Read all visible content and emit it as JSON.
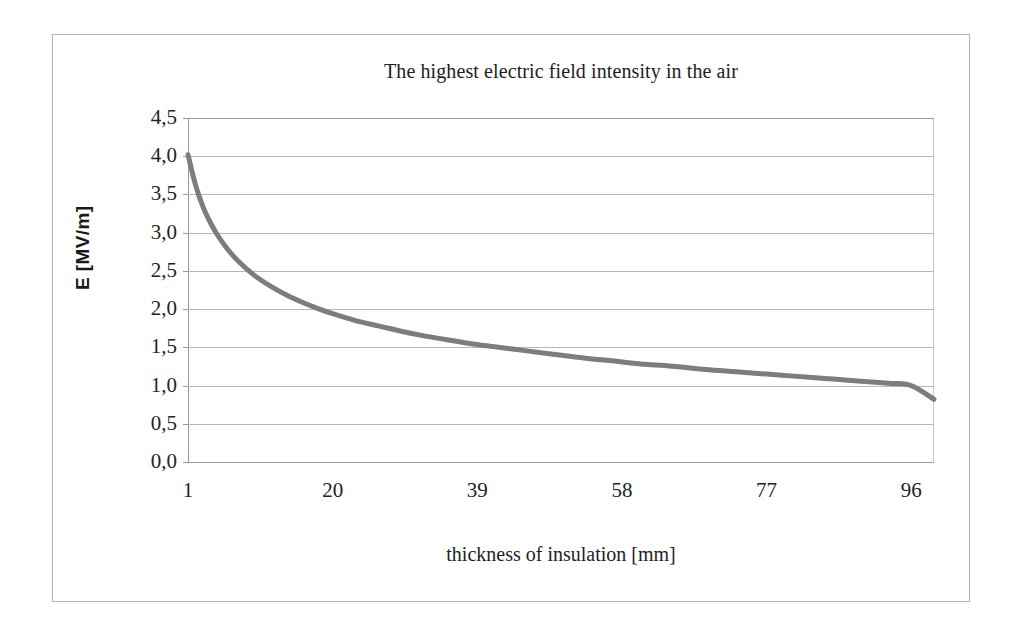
{
  "figure": {
    "frame_border_color": "#b4b4b4",
    "background_color": "#ffffff"
  },
  "chart_data": {
    "type": "line",
    "title": "The highest electric field intensity in the air",
    "xlabel": "thickness of insulation [mm]",
    "ylabel": "E [MV/m]",
    "xlim": [
      1,
      99
    ],
    "ylim": [
      0.0,
      4.5
    ],
    "grid": true,
    "legend": "none",
    "line_color": "#7d7d7d",
    "line_width": 5,
    "y_ticks": [
      "0,0",
      "0,5",
      "1,0",
      "1,5",
      "2,0",
      "2,5",
      "3,0",
      "3,5",
      "4,0",
      "4,5"
    ],
    "y_tick_values": [
      0.0,
      0.5,
      1.0,
      1.5,
      2.0,
      2.5,
      3.0,
      3.5,
      4.0,
      4.5
    ],
    "x_ticks": [
      "1",
      "20",
      "39",
      "58",
      "77",
      "96"
    ],
    "x_tick_values": [
      1,
      20,
      39,
      58,
      77,
      96
    ],
    "series": [
      {
        "name": "E",
        "x": [
          1,
          2,
          3,
          4,
          5,
          6,
          7,
          8,
          9,
          10,
          12,
          14,
          16,
          18,
          20,
          23,
          26,
          29,
          32,
          35,
          38,
          41,
          45,
          49,
          53,
          57,
          61,
          65,
          69,
          73,
          77,
          81,
          85,
          89,
          93,
          96,
          99
        ],
        "values": [
          4.02,
          3.62,
          3.33,
          3.12,
          2.95,
          2.81,
          2.69,
          2.59,
          2.5,
          2.42,
          2.29,
          2.18,
          2.09,
          2.01,
          1.94,
          1.85,
          1.78,
          1.71,
          1.65,
          1.6,
          1.55,
          1.51,
          1.46,
          1.41,
          1.36,
          1.32,
          1.28,
          1.25,
          1.21,
          1.18,
          1.15,
          1.12,
          1.09,
          1.06,
          1.03,
          1.0,
          0.82
        ]
      }
    ]
  }
}
